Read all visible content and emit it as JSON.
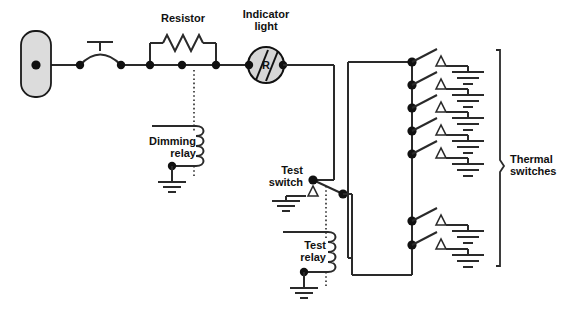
{
  "diagram": {
    "canvas": {
      "width": 569,
      "height": 315,
      "background": "#ffffff"
    },
    "colors": {
      "wire": "#2a2a2a",
      "node": "#111111",
      "text": "#111111",
      "source_fill": "#dcdcdc",
      "lamp_fill": "#d6d6d6"
    },
    "labels": {
      "resistor": "Resistor",
      "indicator_light_line1": "Indicator",
      "indicator_light_line2": "light",
      "lamp_letter": "R",
      "dimming_relay_line1": "Dimming",
      "dimming_relay_line2": "relay",
      "test_switch_line1": "Test",
      "test_switch_line2": "switch",
      "test_relay_line1": "Test",
      "test_relay_line2": "relay",
      "thermal_switches_line1": "Thermal",
      "thermal_switches_line2": "switches"
    },
    "components": [
      {
        "name": "power-source",
        "type": "source",
        "shape": "rounded-rectangle"
      },
      {
        "name": "circuit-breaker",
        "type": "switch",
        "shape": "pushbutton"
      },
      {
        "name": "resistor",
        "type": "resistor",
        "shape": "zigzag"
      },
      {
        "name": "indicator-light",
        "type": "lamp",
        "letter": "R"
      },
      {
        "name": "dimming-relay",
        "type": "relay-coil"
      },
      {
        "name": "test-switch",
        "type": "switch"
      },
      {
        "name": "test-relay",
        "type": "relay-coil"
      },
      {
        "name": "thermal-switches",
        "type": "switch-bank",
        "count": 7
      }
    ],
    "thermal_switch_count": 7,
    "ground_symbol_count": 10
  }
}
